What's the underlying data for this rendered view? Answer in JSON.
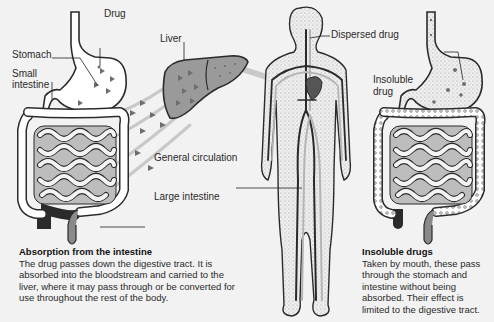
{
  "colors": {
    "background": "#f2f2f2",
    "organ_fill": "#ffffff",
    "organ_outline": "#2b2b2b",
    "liver_fill": "#9a9a9a",
    "drug_marker": "#6e6e6e",
    "blood_dark": "#2a2a2a",
    "blood_light": "#b5b5b5",
    "heart": "#555555",
    "body_stipple": "#e6e6e6"
  },
  "labels": {
    "drug": "Drug",
    "stomach": "Stomach",
    "small_intestine_line1": "Small",
    "small_intestine_line2": "intestine",
    "liver": "Liver",
    "dispersed_drug": "Dispersed drug",
    "general_circulation": "General circulation",
    "large_intestine": "Large intestine",
    "insoluble_drug_line1": "Insoluble",
    "insoluble_drug_line2": "drug"
  },
  "captions": {
    "absorption": {
      "title": "Absorption from the intestine",
      "body": "The drug passes down the digestive tract. It is absorbed into the bloodstream and carried to the liver, where it may pass through or be converted for use throughout the rest of the body."
    },
    "insoluble": {
      "title": "Insoluble drugs",
      "body": "Taken by mouth, these pass through the stomach and intestine without being absorbed. Their effect is limited to the digestive tract."
    }
  }
}
